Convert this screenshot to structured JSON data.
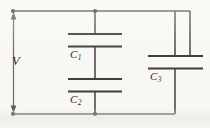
{
  "figure": {
    "kind": "circuit-diagram",
    "width": 210,
    "height": 128,
    "background_color": "#f8f7f3",
    "wire_color": "#4d4d4d",
    "plate_color": "#3f3f3f",
    "label_color": "#2b2b2b"
  },
  "labels": {
    "source": {
      "symbol": "V",
      "subscript": ""
    },
    "capacitor_1": {
      "symbol": "C",
      "subscript": "1"
    },
    "capacitor_2": {
      "symbol": "C",
      "subscript": "2"
    },
    "capacitor_3": {
      "symbol": "C",
      "subscript": "3"
    }
  },
  "geometry": {
    "top_wire": {
      "y": 11,
      "x1": 13,
      "x2": 190
    },
    "bottom_wire": {
      "y": 114,
      "x1": 13,
      "x2": 175
    },
    "left_rail": {
      "x": 13,
      "y1": 11,
      "y2": 114
    },
    "right_rail": {
      "x": 190,
      "y1": 11,
      "y2": 56
    },
    "middle_branch_x": 95,
    "right_branch_x": 175,
    "capacitor_1": {
      "plate_top_y": 34,
      "plate_bottom_y": 46,
      "plate_x1": 68,
      "plate_x2": 122
    },
    "capacitor_2": {
      "plate_top_y": 79,
      "plate_bottom_y": 91,
      "plate_x1": 68,
      "plate_x2": 122
    },
    "capacitor_3": {
      "plate_top_y": 56,
      "plate_bottom_y": 68,
      "plate_x1": 148,
      "plate_x2": 203
    },
    "nodes": [
      {
        "x": 13,
        "y": 11
      },
      {
        "x": 95,
        "y": 11
      },
      {
        "x": 13,
        "y": 114
      },
      {
        "x": 95,
        "y": 114
      }
    ]
  }
}
